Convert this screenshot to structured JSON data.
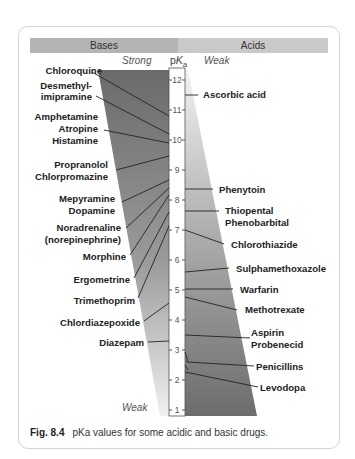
{
  "header": {
    "left": "Bases",
    "right": "Acids"
  },
  "subheaders": {
    "bases_top": "Strong",
    "acids_top": "Weak",
    "bases_bottom": "Weak",
    "acids_bottom": "Strong"
  },
  "scale": {
    "label_main": "p",
    "label_k": "K",
    "label_sub": "a",
    "ticks": [
      "12",
      "11",
      "10",
      "9",
      "8",
      "7",
      "6",
      "5",
      "4",
      "3",
      "2",
      "1"
    ]
  },
  "bases": [
    {
      "label": "Chloroquine",
      "pka": 10.8
    },
    {
      "label": "Desmethyl-",
      "label2": "imipramine",
      "pka": 10.2
    },
    {
      "label": "Amphetamine",
      "pka": 9.9
    },
    {
      "label": "Atropine",
      "pka": 9.9
    },
    {
      "label": "Histamine",
      "pka": 9.8
    },
    {
      "label": "Propranolol",
      "pka": 9.4
    },
    {
      "label": "Chlorpromazine",
      "pka": 9.3
    },
    {
      "label": "Mepyramine",
      "pka": 8.9
    },
    {
      "label": "Dopamine",
      "pka": 8.9
    },
    {
      "label": "Noradrenaline",
      "label2": "(norepinephrine)",
      "pka": 8.6
    },
    {
      "label": "Morphine",
      "pka": 8.0
    },
    {
      "label": "Ergometrine",
      "pka": 6.8
    },
    {
      "label": "Trimethoprim",
      "pka": 7.2
    },
    {
      "label": "Chlordiazepoxide",
      "pka": 4.6
    },
    {
      "label": "Diazepam",
      "pka": 3.3
    }
  ],
  "acids": [
    {
      "label": "Ascorbic acid",
      "pka": 11.5
    },
    {
      "label": "Phenytoin",
      "pka": 8.3
    },
    {
      "label": "Thiopental",
      "pka": 7.6
    },
    {
      "label": "Phenobarbital",
      "pka": 7.4
    },
    {
      "label": "Chlorothiazide",
      "pka": 6.8
    },
    {
      "label": "Sulphamethoxazole",
      "pka": 5.6
    },
    {
      "label": "Warfarin",
      "pka": 5.0
    },
    {
      "label": "Methotrexate",
      "pka": 4.8
    },
    {
      "label": "Aspirin",
      "pka": 3.5
    },
    {
      "label": "Probenecid",
      "pka": 3.4
    },
    {
      "label": "Penicillins",
      "pka": 2.7
    },
    {
      "label": "Levodopa",
      "pka": 2.3
    }
  ],
  "caption": {
    "fig": "Fig. 8.4",
    "text": "pKa values for some acidic and basic drugs."
  },
  "colors": {
    "bases_bar": "#b4b4b4",
    "acids_bar": "#c9c9c9",
    "wedge_dark": "#6e6e6e",
    "wedge_light": "#ececec"
  }
}
